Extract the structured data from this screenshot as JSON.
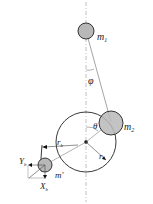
{
  "diagram": {
    "labels": {
      "m1": "m",
      "m1_sub": "1",
      "m2": "m",
      "m2_sub": "2",
      "phi": "φ",
      "theta": "θ",
      "r": "r",
      "rb": "r",
      "rb_sub": "b",
      "mprime": "m'",
      "Yb": "Y",
      "Yb_sub": "b",
      "Xb": "X",
      "Xb_sub": "b"
    },
    "colors": {
      "mass_fill": "#b8b8b8",
      "stroke": "#222222",
      "guide": "#888888"
    }
  }
}
